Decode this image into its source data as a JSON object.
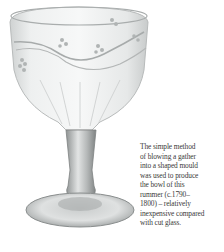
{
  "figure": {
    "caption_lines": [
      "The simple method",
      "of blowing a gather",
      "into a shaped mould",
      "was used to produce",
      "the bowl of this",
      "rummer (c.1790–",
      "1800) – relatively",
      "inexpensive compared",
      "with cut glass."
    ]
  }
}
